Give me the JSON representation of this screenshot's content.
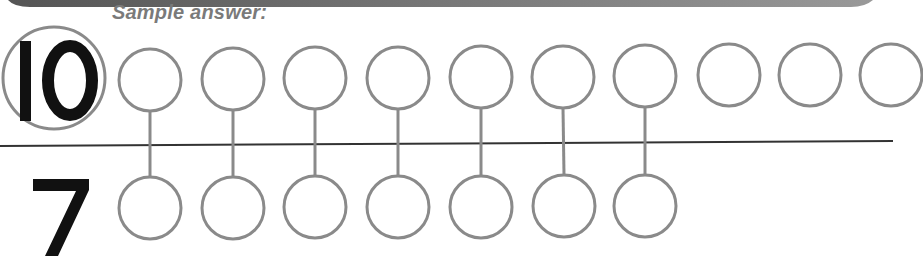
{
  "header": {
    "caption": "Sample answer:",
    "band": {
      "x1": 8,
      "x2": 873,
      "height": 7,
      "color_start": "#555555",
      "color_end": "#999999"
    }
  },
  "colors": {
    "circle_stroke": "#8a8a8a",
    "numeral": "#111111",
    "divider": "#333333",
    "connector": "#8a8a8a"
  },
  "top_row": {
    "numeral": "10",
    "count": 10,
    "highlight_circle": {
      "cx": 54,
      "cy": 78,
      "r": 51
    },
    "circles": [
      {
        "cx": 150,
        "cy": 80
      },
      {
        "cx": 233,
        "cy": 79
      },
      {
        "cx": 315,
        "cy": 78
      },
      {
        "cx": 398,
        "cy": 78
      },
      {
        "cx": 481,
        "cy": 77
      },
      {
        "cx": 563,
        "cy": 77
      },
      {
        "cx": 645,
        "cy": 76
      },
      {
        "cx": 729,
        "cy": 75
      },
      {
        "cx": 810,
        "cy": 75
      },
      {
        "cx": 891,
        "cy": 75
      }
    ]
  },
  "bottom_row": {
    "numeral": "7",
    "count": 7,
    "circles": [
      {
        "cx": 150,
        "cy": 208
      },
      {
        "cx": 233,
        "cy": 208
      },
      {
        "cx": 315,
        "cy": 207
      },
      {
        "cx": 398,
        "cy": 207
      },
      {
        "cx": 481,
        "cy": 207
      },
      {
        "cx": 564,
        "cy": 206
      },
      {
        "cx": 645,
        "cy": 206
      }
    ]
  },
  "circle_radius": 31,
  "divider": {
    "x1": 0,
    "y1": 146,
    "x2": 893,
    "y2": 141
  },
  "pairs_connected": 7
}
